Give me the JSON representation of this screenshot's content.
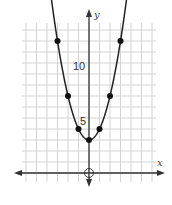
{
  "chart_data": {
    "type": "line",
    "title": "",
    "function": "y = x^2 + 3",
    "xlabel": "x",
    "ylabel": "y",
    "x": [
      -3,
      -2,
      -1,
      0,
      1,
      2,
      3
    ],
    "values": [
      12,
      7,
      4,
      3,
      4,
      7,
      12
    ],
    "points": [
      [
        -3,
        12
      ],
      [
        -2,
        7
      ],
      [
        -1,
        4
      ],
      [
        0,
        3
      ],
      [
        1,
        4
      ],
      [
        2,
        7
      ],
      [
        3,
        12
      ]
    ],
    "y_tick_labels": [
      "5",
      "10"
    ],
    "origin_marker": "open-circle",
    "xlim": [
      -6,
      6
    ],
    "ylim": [
      -1,
      14
    ],
    "grid": true,
    "colors": {
      "curve": "#222222",
      "grid": "#d0d0d0",
      "axis": "#333333"
    }
  },
  "labels": {
    "x_axis": "x",
    "y_axis": "y",
    "tick_5": "5",
    "tick_10": "10"
  }
}
